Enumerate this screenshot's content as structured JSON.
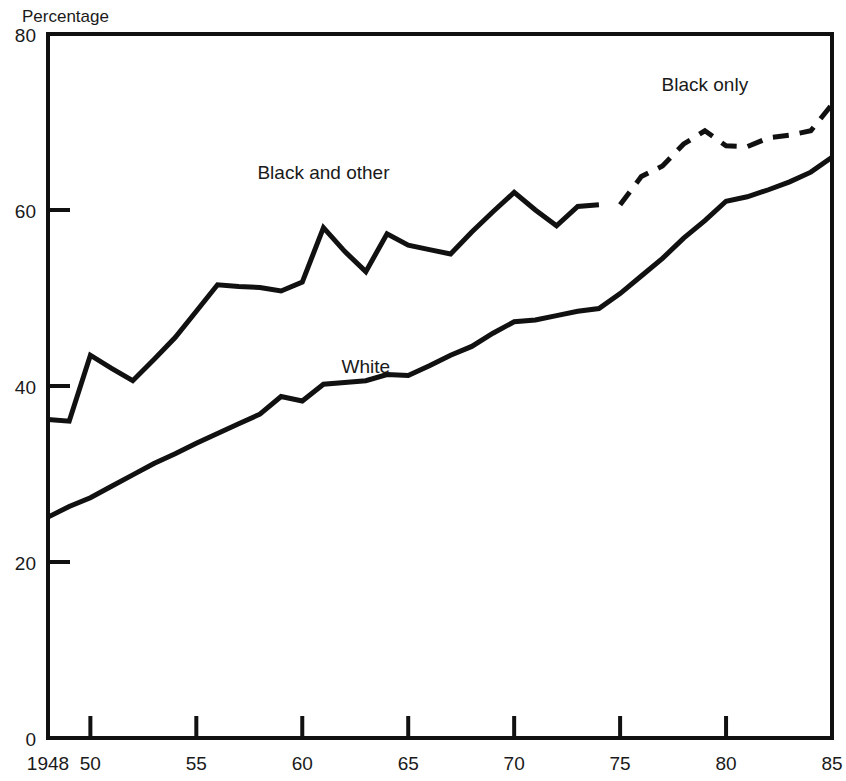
{
  "chart_data": {
    "type": "line",
    "title": "",
    "subtitle": "",
    "xlabel": "",
    "ylabel": "Percentage",
    "xlim": [
      1948,
      1985
    ],
    "ylim": [
      0,
      80
    ],
    "grid": false,
    "legend_position": "inline-annotations",
    "x_tick_labels": [
      "1948",
      "50",
      "55",
      "60",
      "65",
      "70",
      "75",
      "80",
      "85"
    ],
    "x_tick_values": [
      1948,
      1950,
      1955,
      1960,
      1965,
      1970,
      1975,
      1980,
      1985
    ],
    "y_tick_labels": [
      "0",
      "20",
      "40",
      "60",
      "80"
    ],
    "y_tick_values": [
      0,
      20,
      40,
      60,
      80
    ],
    "annotations": [
      {
        "text": "Black and other",
        "x": 1961,
        "y": 63.5
      },
      {
        "text": "White",
        "x": 1963,
        "y": 41.5
      },
      {
        "text": "Black only",
        "x": 1979,
        "y": 73.5
      }
    ],
    "series": [
      {
        "name": "Black and other",
        "style": "solid",
        "color": "#111111",
        "x": [
          1948,
          1949,
          1950,
          1951,
          1952,
          1953,
          1954,
          1955,
          1956,
          1957,
          1958,
          1959,
          1960,
          1961,
          1962,
          1963,
          1964,
          1965,
          1966,
          1967,
          1968,
          1969,
          1970,
          1971,
          1972,
          1973,
          1974
        ],
        "values": [
          36.2,
          36.0,
          43.5,
          42.0,
          40.6,
          43.0,
          45.5,
          48.5,
          51.5,
          51.3,
          51.2,
          50.8,
          51.8,
          58.0,
          55.3,
          53.0,
          57.3,
          56.0,
          55.5,
          55.0,
          57.5,
          59.8,
          62.0,
          60.0,
          58.2,
          60.4,
          60.6
        ],
        "description": "Black and other workers, solid line, 1948-1974"
      },
      {
        "name": "Black only",
        "style": "dashed",
        "color": "#111111",
        "x": [
          1975,
          1976,
          1977,
          1978,
          1979,
          1980,
          1981,
          1982,
          1983,
          1984,
          1985
        ],
        "values": [
          60.6,
          63.8,
          65.0,
          67.5,
          69.0,
          67.3,
          67.2,
          68.2,
          68.5,
          69.0,
          72.0
        ],
        "description": "Black only workers, dashed line, 1975-1985"
      },
      {
        "name": "White",
        "style": "solid",
        "color": "#111111",
        "x": [
          1948,
          1949,
          1950,
          1951,
          1952,
          1953,
          1954,
          1955,
          1956,
          1957,
          1958,
          1959,
          1960,
          1961,
          1962,
          1963,
          1964,
          1965,
          1966,
          1967,
          1968,
          1969,
          1970,
          1971,
          1972,
          1973,
          1974,
          1975,
          1976,
          1977,
          1978,
          1979,
          1980,
          1981,
          1982,
          1983,
          1984,
          1985
        ],
        "values": [
          25.1,
          26.3,
          27.3,
          28.6,
          29.9,
          31.2,
          32.3,
          33.5,
          34.6,
          35.7,
          36.8,
          38.8,
          38.3,
          40.2,
          40.4,
          40.6,
          41.3,
          41.2,
          42.3,
          43.5,
          44.5,
          46.0,
          47.3,
          47.5,
          48.0,
          48.5,
          48.8,
          50.5,
          52.5,
          54.5,
          56.8,
          58.8,
          61.0,
          61.5,
          62.3,
          63.2,
          64.3,
          66.0
        ],
        "description": "White workers, solid line, 1948-1985"
      }
    ]
  },
  "labels": {
    "y_axis_title": "Percentage"
  }
}
